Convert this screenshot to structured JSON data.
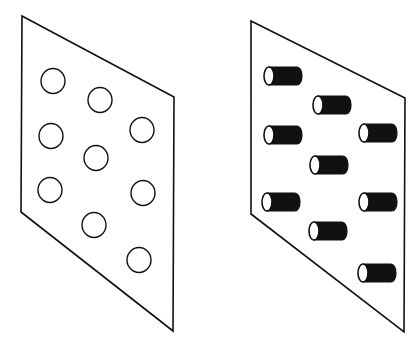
{
  "diagram": {
    "panels": [
      {
        "id": "left-panel",
        "description": "plane with circular holes",
        "outline": [
          [
            22,
            16
          ],
          [
            174,
            97
          ],
          [
            173,
            331
          ],
          [
            21,
            212
          ]
        ],
        "holes": [
          {
            "cx": 53,
            "cy": 81
          },
          {
            "cx": 100,
            "cy": 100
          },
          {
            "cx": 51,
            "cy": 136
          },
          {
            "cx": 142,
            "cy": 130
          },
          {
            "cx": 96,
            "cy": 158
          },
          {
            "cx": 50,
            "cy": 190
          },
          {
            "cx": 143,
            "cy": 193
          },
          {
            "cx": 94,
            "cy": 225
          },
          {
            "cx": 139,
            "cy": 260
          }
        ],
        "hole_radius": 12
      },
      {
        "id": "right-panel",
        "description": "plane with cylindrical rods",
        "outline": [
          [
            251,
            21
          ],
          [
            405,
            98
          ],
          [
            404,
            332
          ],
          [
            251,
            214
          ]
        ],
        "rods": [
          {
            "x": 269,
            "y": 76
          },
          {
            "x": 318,
            "y": 105
          },
          {
            "x": 269,
            "y": 135
          },
          {
            "x": 364,
            "y": 133
          },
          {
            "x": 315,
            "y": 165
          },
          {
            "x": 267,
            "y": 202
          },
          {
            "x": 364,
            "y": 202
          },
          {
            "x": 314,
            "y": 231
          },
          {
            "x": 363,
            "y": 273
          }
        ],
        "rod_length": 28,
        "rod_radius_y": 9,
        "rod_radius_x": 5
      }
    ],
    "colors": {
      "stroke": "#111111",
      "rod_fill": "#111111",
      "background": "#ffffff"
    }
  }
}
